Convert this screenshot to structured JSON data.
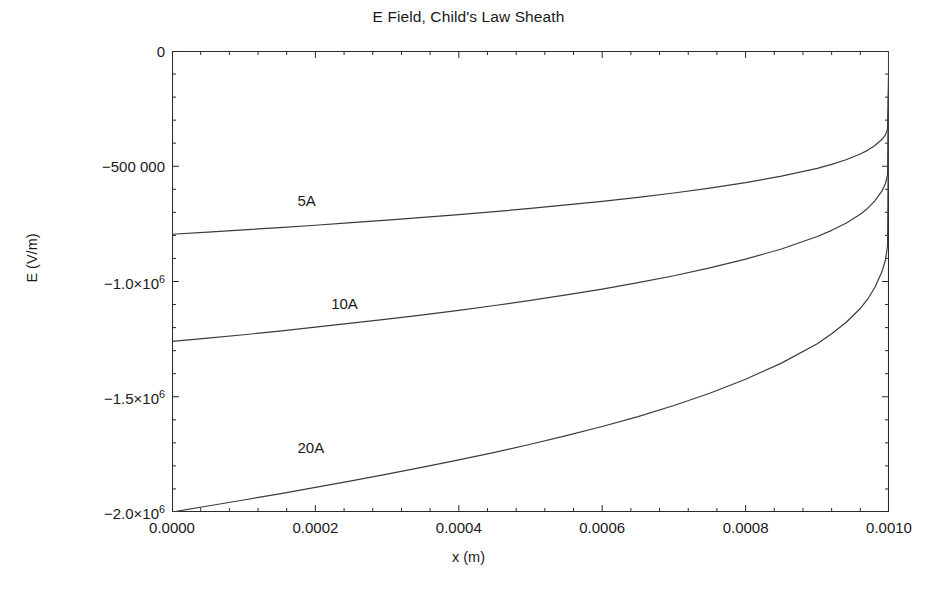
{
  "chart_data": {
    "type": "line",
    "title": "E Field, Child's Law Sheath",
    "xlabel": "x (m)",
    "ylabel": "E (V/m)",
    "xlim": [
      0.0,
      0.001
    ],
    "ylim": [
      -2000000,
      0
    ],
    "grid": false,
    "legend_position": "inline-annotations",
    "xticks": [
      0.0,
      0.0002,
      0.0004,
      0.0006,
      0.0008,
      0.001
    ],
    "xtick_labels": [
      "0.0000",
      "0.0002",
      "0.0004",
      "0.0006",
      "0.0008",
      "0.0010"
    ],
    "yticks": [
      0,
      -500000,
      -1000000,
      -1500000,
      -2000000
    ],
    "ytick_labels": [
      "0",
      "-500 000",
      "-1.0×10⁶",
      "-1.5×10⁶",
      "-2.0×10⁶"
    ],
    "xminor_tick_count": 4,
    "yminor_tick_count": 4,
    "x": [
      0.0,
      5e-05,
      0.0001,
      0.00015,
      0.0002,
      0.00025,
      0.0003,
      0.00035,
      0.0004,
      0.00045,
      0.0005,
      0.00055,
      0.0006,
      0.00065,
      0.0007,
      0.00075,
      0.0008,
      0.00085,
      0.0009,
      0.00092,
      0.00094,
      0.00096,
      0.00097,
      0.00098,
      0.00099,
      0.000995,
      0.000998,
      0.001
    ],
    "series": [
      {
        "name": "5A",
        "label": "5A",
        "label_x": 0.000175,
        "label_y": -655000,
        "color": "#3c3c3c",
        "values": [
          -795000,
          -786000,
          -776000,
          -766000,
          -756000,
          -745000,
          -734000,
          -722000,
          -710000,
          -697000,
          -683000,
          -668000,
          -652000,
          -635000,
          -616000,
          -595000,
          -571000,
          -543000,
          -509000,
          -492000,
          -472000,
          -447000,
          -431000,
          -411000,
          -384000,
          -364000,
          -339000,
          0
        ]
      },
      {
        "name": "10A",
        "label": "10A",
        "label_x": 0.000222,
        "label_y": -1102000,
        "color": "#3c3c3c",
        "values": [
          -1260000,
          -1246000,
          -1231000,
          -1215000,
          -1198000,
          -1181000,
          -1163000,
          -1145000,
          -1125000,
          -1104000,
          -1082000,
          -1058000,
          -1033000,
          -1005000,
          -975000,
          -941000,
          -903000,
          -859000,
          -805000,
          -778000,
          -747000,
          -708000,
          -683000,
          -651000,
          -608000,
          -576000,
          -536000,
          0
        ]
      },
      {
        "name": "20A",
        "label": "20A",
        "label_x": 0.000175,
        "label_y": -1727000,
        "color": "#3c3c3c",
        "values": [
          -2000000,
          -1974000,
          -1948000,
          -1921000,
          -1893000,
          -1865000,
          -1836000,
          -1805000,
          -1774000,
          -1741000,
          -1706000,
          -1669000,
          -1629000,
          -1586000,
          -1538000,
          -1485000,
          -1424000,
          -1354000,
          -1270000,
          -1227000,
          -1178000,
          -1117000,
          -1078000,
          -1027000,
          -959000,
          -908000,
          -845000,
          0
        ]
      }
    ]
  },
  "colors": {
    "axis": "#2b2b2b",
    "curve": "#3c3c3c",
    "background": "#ffffff",
    "text": "#1a1a1a"
  }
}
